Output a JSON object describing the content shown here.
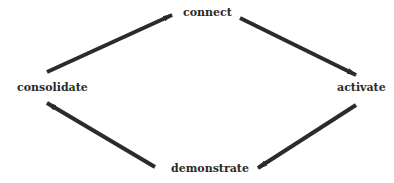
{
  "diagram": {
    "type": "cycle",
    "nodes": [
      {
        "id": "connect",
        "label": "connect"
      },
      {
        "id": "activate",
        "label": "activate"
      },
      {
        "id": "demonstrate",
        "label": "demonstrate"
      },
      {
        "id": "consolidate",
        "label": "consolidate"
      }
    ],
    "edges": [
      {
        "from": "connect",
        "to": "activate"
      },
      {
        "from": "activate",
        "to": "demonstrate"
      },
      {
        "from": "demonstrate",
        "to": "consolidate"
      },
      {
        "from": "consolidate",
        "to": "connect"
      }
    ],
    "arrow_color": "#2b2b2b",
    "text_color": "#2a2a2a"
  }
}
